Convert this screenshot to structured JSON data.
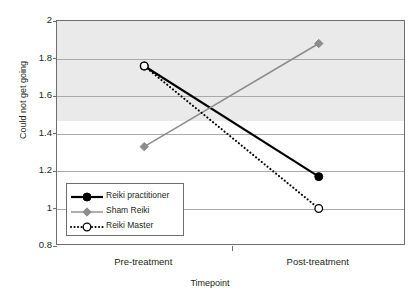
{
  "chart_data": {
    "type": "line",
    "title": "",
    "xlabel": "Timepoint",
    "ylabel": "Could not get going",
    "categories": [
      "Pre-treatment",
      "Post-treatment"
    ],
    "ylim": [
      0.8,
      2
    ],
    "yticks": [
      "2",
      "1.8",
      "1.6",
      "1.4",
      "1.2",
      "1",
      "0.8"
    ],
    "ytick_values": [
      2,
      1.8,
      1.6,
      1.4,
      1.2,
      1,
      0.8
    ],
    "grid": true,
    "legend_position": "inside-bottom-left",
    "series": [
      {
        "name": "Reiki practitioner",
        "values": [
          1.76,
          1.17
        ],
        "color": "#000000",
        "line_style": "solid",
        "marker": "filled-circle"
      },
      {
        "name": "Sham Reiki",
        "values": [
          1.33,
          1.88
        ],
        "color": "#8c8c8c",
        "line_style": "solid",
        "marker": "filled-diamond"
      },
      {
        "name": "Reiki Master",
        "values": [
          1.76,
          1.0
        ],
        "color": "#000000",
        "line_style": "dotted",
        "marker": "open-circle"
      }
    ]
  }
}
